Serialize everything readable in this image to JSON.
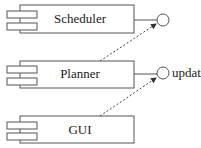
{
  "diagram": {
    "type": "UML component diagram",
    "components": [
      {
        "name": "Scheduler",
        "interface": ""
      },
      {
        "name": "Planner",
        "interface": "update"
      },
      {
        "name": "GUI",
        "interface": ""
      }
    ],
    "dependencies": [
      {
        "from": "Planner",
        "to": "Scheduler interface",
        "style": "dashed-arrow"
      },
      {
        "from": "GUI",
        "to": "Planner interface update",
        "style": "dashed-arrow"
      }
    ],
    "colors": {
      "stroke": "#444444",
      "background": "#ffffff"
    }
  }
}
